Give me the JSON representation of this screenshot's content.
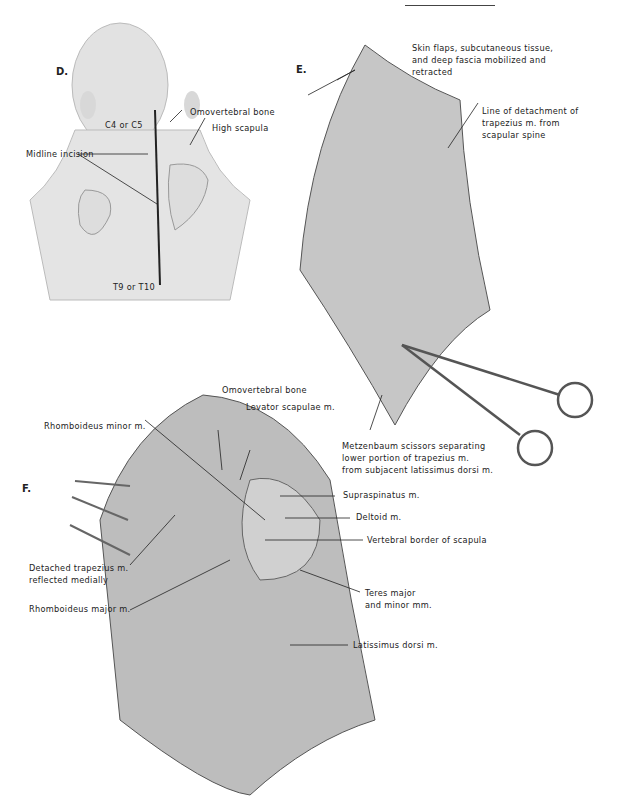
{
  "figure": {
    "panels": [
      {
        "id": "D",
        "label": "D.",
        "annotations": [
          {
            "text": "C4 or C5"
          },
          {
            "text": "Omovertebral bone"
          },
          {
            "text": "High scapula"
          },
          {
            "text": "Midline incision"
          },
          {
            "text": "T9 or T10"
          }
        ]
      },
      {
        "id": "E",
        "label": "E.",
        "annotations": [
          {
            "text": "Skin flaps, subcutaneous tissue,"
          },
          {
            "text": "and deep fascia mobilized and"
          },
          {
            "text": "retracted"
          },
          {
            "text": "Line of detachment of"
          },
          {
            "text": "trapezius m. from"
          },
          {
            "text": "scapular spine"
          },
          {
            "text": "Metzenbaum scissors separating"
          },
          {
            "text": "lower portion of trapezius m."
          },
          {
            "text": "from subjacent latissimus dorsi m."
          }
        ]
      },
      {
        "id": "F",
        "label": "F.",
        "annotations": [
          {
            "text": "Omovertebral bone"
          },
          {
            "text": "Levator scapulae m."
          },
          {
            "text": "Rhomboideus minor m."
          },
          {
            "text": "Supraspinatus m."
          },
          {
            "text": "Deltoid m."
          },
          {
            "text": "Vertebral border of scapula"
          },
          {
            "text": "Detached trapezius m."
          },
          {
            "text": "reflected medially"
          },
          {
            "text": "Rhomboideus major m."
          },
          {
            "text": "Teres major"
          },
          {
            "text": "and minor mm."
          },
          {
            "text": "Latissimus dorsi m."
          }
        ]
      }
    ]
  },
  "colors": {
    "ink": "#222222",
    "skin": "#e4e4e4",
    "muscle": "#b9b9b9",
    "shadow": "#d6d6d6"
  }
}
